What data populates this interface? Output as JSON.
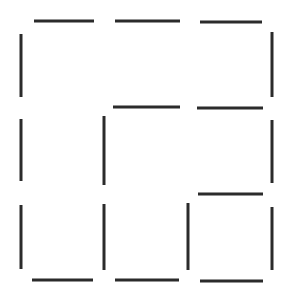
{
  "diagram": {
    "type": "matchstick-grid",
    "canvas": {
      "width": 293,
      "height": 303,
      "background": "#ffffff"
    },
    "stroke": {
      "color": "#2b2b2b",
      "width": 3
    },
    "sticks": [
      {
        "id": "top-1",
        "orientation": "horizontal",
        "x1": 34,
        "y1": 21,
        "x2": 94,
        "y2": 21
      },
      {
        "id": "top-2",
        "orientation": "horizontal",
        "x1": 115,
        "y1": 21,
        "x2": 180,
        "y2": 21
      },
      {
        "id": "top-3",
        "orientation": "horizontal",
        "x1": 200,
        "y1": 22,
        "x2": 262,
        "y2": 22
      },
      {
        "id": "left-1",
        "orientation": "vertical",
        "x1": 21,
        "y1": 34,
        "x2": 21,
        "y2": 97
      },
      {
        "id": "right-1",
        "orientation": "vertical",
        "x1": 272,
        "y1": 32,
        "x2": 272,
        "y2": 97
      },
      {
        "id": "mid-h-2",
        "orientation": "horizontal",
        "x1": 113,
        "y1": 107,
        "x2": 180,
        "y2": 107
      },
      {
        "id": "mid-h-3",
        "orientation": "horizontal",
        "x1": 197,
        "y1": 108,
        "x2": 263,
        "y2": 108
      },
      {
        "id": "left-2",
        "orientation": "vertical",
        "x1": 21,
        "y1": 119,
        "x2": 21,
        "y2": 181
      },
      {
        "id": "inner-v-2",
        "orientation": "vertical",
        "x1": 104,
        "y1": 116,
        "x2": 104,
        "y2": 185
      },
      {
        "id": "right-2",
        "orientation": "vertical",
        "x1": 272,
        "y1": 120,
        "x2": 272,
        "y2": 183
      },
      {
        "id": "low-h-3",
        "orientation": "horizontal",
        "x1": 198,
        "y1": 194,
        "x2": 263,
        "y2": 194
      },
      {
        "id": "left-3",
        "orientation": "vertical",
        "x1": 21,
        "y1": 205,
        "x2": 21,
        "y2": 269
      },
      {
        "id": "inner-v-3a",
        "orientation": "vertical",
        "x1": 104,
        "y1": 204,
        "x2": 104,
        "y2": 270
      },
      {
        "id": "inner-v-3b",
        "orientation": "vertical",
        "x1": 188,
        "y1": 203,
        "x2": 188,
        "y2": 270
      },
      {
        "id": "right-3",
        "orientation": "vertical",
        "x1": 272,
        "y1": 207,
        "x2": 272,
        "y2": 270
      },
      {
        "id": "bottom-1",
        "orientation": "horizontal",
        "x1": 32,
        "y1": 280,
        "x2": 93,
        "y2": 280
      },
      {
        "id": "bottom-2",
        "orientation": "horizontal",
        "x1": 115,
        "y1": 280,
        "x2": 179,
        "y2": 280
      },
      {
        "id": "bottom-3",
        "orientation": "horizontal",
        "x1": 200,
        "y1": 281,
        "x2": 263,
        "y2": 281
      }
    ]
  }
}
